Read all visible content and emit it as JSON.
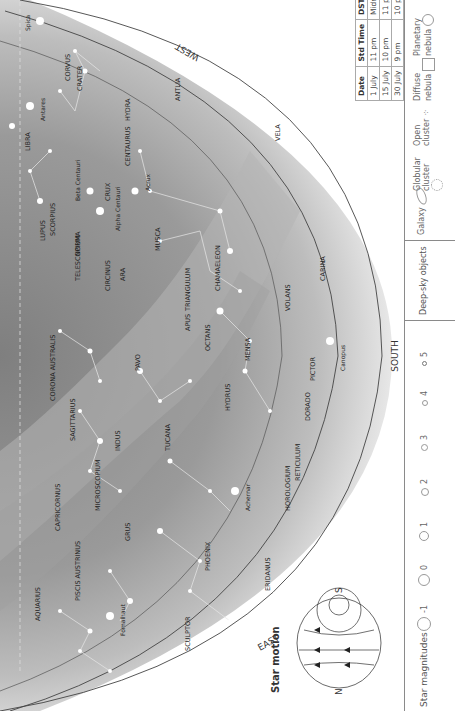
{
  "header": {
    "text": "Month by month · July"
  },
  "directions": {
    "south": "SOUTH",
    "west": "WEST",
    "east": "EAST"
  },
  "horizons": {
    "h0": "Horizon 0°",
    "h20": "Horizon 20°S",
    "h40": "Horizon 40°S"
  },
  "ecliptic": "Ecliptic",
  "constellations": [
    "CRATER",
    "CORVUS",
    "HYDRA",
    "ANTLIA",
    "VELA",
    "CENTAURUS",
    "CRUX",
    "LIBRA",
    "LUPUS",
    "SCORPIUS",
    "NORMA",
    "ARA",
    "CIRCINUS",
    "TRIANGULUM AUSTRALE",
    "MUSCA",
    "CHAMAELEON",
    "CARINA",
    "VOLANS",
    "APUS",
    "OCTANS",
    "MENSA",
    "PICTOR",
    "TELESCOPIUM",
    "CORONA AUSTRALIS",
    "SAGITTARIUS",
    "PAVO",
    "HYDRUS",
    "DORADO",
    "INDUS",
    "TUCANA",
    "RETICULUM",
    "HOROLOGIUM",
    "MICROSCOPIUM",
    "GRUS",
    "CAPRICORNUS",
    "PHOENIX",
    "ERIDANUS",
    "PISCIS AUSTRINUS",
    "AQUARIUS",
    "SCULPTOR"
  ],
  "stars": [
    "Spica",
    "Antares",
    "Beta Centauri",
    "Alpha Centauri",
    "Acrux",
    "Canopus",
    "Achernar",
    "Fomalhaut"
  ],
  "objects": [
    "5139",
    "4755",
    "Coalsack",
    "3372",
    "IC 2602",
    "M6",
    "M7",
    "M8",
    "M22",
    "6231",
    "2070",
    "LMC",
    "SMC",
    "104",
    "6405",
    "Teapot",
    "2075"
  ],
  "time_table": {
    "headers": [
      "Date",
      "Std Time",
      "DST"
    ],
    "rows": [
      [
        "1 July",
        "11 pm",
        "Midnight"
      ],
      [
        "15 July",
        "10 pm",
        "11 pm"
      ],
      [
        "30 July",
        "9 pm",
        "10 pm"
      ]
    ]
  },
  "star_motion": {
    "title": "Star motion",
    "n": "N",
    "s": "S"
  },
  "legend": {
    "magnitudes_label": "Star magnitudes",
    "magnitudes": [
      "-1",
      "0",
      "1",
      "2",
      "3",
      "4",
      "5"
    ],
    "deep_sky_label": "Deep-sky objects",
    "deep_sky": [
      "Galaxy",
      "Globular cluster",
      "Open cluster",
      "Diffuse nebula",
      "Planetary nebula"
    ]
  },
  "colors": {
    "sky_dark": "#8c8c8c",
    "sky_mid": "#a9a9a9",
    "sky_light": "#d9d9d9",
    "milky_way": "#b8b8b8",
    "horizon_line": "#444444"
  }
}
